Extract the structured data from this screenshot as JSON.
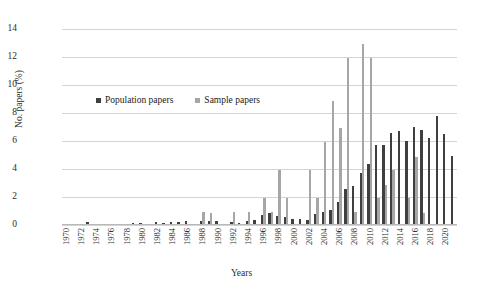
{
  "chart_data": {
    "type": "bar",
    "title": "",
    "xlabel": "Years",
    "ylabel": "No. papers (%)",
    "ylim": [
      0,
      14
    ],
    "yticks": [
      0,
      2,
      4,
      6,
      8,
      10,
      12,
      14
    ],
    "grid": true,
    "legend_position": "inside-upper-left",
    "categories": [
      "1970",
      "1971",
      "1972",
      "1973",
      "1974",
      "1975",
      "1976",
      "1977",
      "1978",
      "1979",
      "1980",
      "1981",
      "1982",
      "1983",
      "1984",
      "1985",
      "1986",
      "1987",
      "1988",
      "1989",
      "1990",
      "1991",
      "1992",
      "1993",
      "1994",
      "1995",
      "1996",
      "1997",
      "1998",
      "1999",
      "2000",
      "2001",
      "2002",
      "2003",
      "2004",
      "2005",
      "2006",
      "2007",
      "2008",
      "2009",
      "2010",
      "2011",
      "2012",
      "2013",
      "2014",
      "2015",
      "2016",
      "2017",
      "2018",
      "2019",
      "2020",
      "2021"
    ],
    "x_tick_labels": [
      "1970",
      "1972",
      "1974",
      "1976",
      "1978",
      "1980",
      "1982",
      "1984",
      "1986",
      "1988",
      "1990",
      "1992",
      "1994",
      "1996",
      "1998",
      "2000",
      "2002",
      "2004",
      "2006",
      "2008",
      "2010",
      "2012",
      "2014",
      "2016",
      "2018",
      "2020"
    ],
    "series": [
      {
        "name": "Population papers",
        "color": "#3f3f3f",
        "values": [
          0.1,
          0.1,
          0.1,
          0.18,
          0.0,
          0.0,
          0.1,
          0.1,
          0.1,
          0.12,
          0.12,
          0.1,
          0.2,
          0.12,
          0.25,
          0.25,
          0.28,
          0.1,
          0.3,
          0.32,
          0.3,
          0.1,
          0.18,
          0.15,
          0.28,
          0.38,
          0.7,
          0.85,
          0.62,
          0.55,
          0.42,
          0.4,
          0.38,
          0.78,
          0.92,
          1.1,
          1.65,
          2.55,
          2.78,
          3.68,
          4.38,
          5.72,
          5.75,
          6.58,
          6.68,
          6.0,
          6.98,
          6.78,
          6.2,
          7.8,
          6.5,
          4.95
        ]
      },
      {
        "name": "Sample papers",
        "color": "#a6a6a6",
        "values": [
          0.0,
          0.0,
          0.0,
          0.0,
          0.0,
          0.0,
          0.0,
          0.0,
          0.0,
          0.0,
          0.0,
          0.0,
          0.0,
          0.0,
          0.0,
          0.0,
          0.0,
          0.0,
          0.95,
          0.88,
          0.0,
          0.0,
          0.92,
          0.0,
          0.95,
          0.0,
          1.95,
          0.9,
          3.92,
          1.95,
          0.0,
          0.0,
          3.92,
          1.92,
          5.9,
          8.88,
          6.92,
          11.9,
          0.92,
          12.9,
          11.9,
          1.9,
          2.85,
          3.9,
          0.0,
          1.9,
          4.88,
          0.88,
          0.0,
          0.0,
          0.0,
          0.0
        ]
      }
    ]
  },
  "legend": {
    "entries": [
      {
        "label": "Population papers",
        "color": "#3f3f3f",
        "swatch": "square-marker"
      },
      {
        "label": "Sample papers",
        "color": "#a6a6a6",
        "swatch": "square-marker"
      }
    ]
  }
}
